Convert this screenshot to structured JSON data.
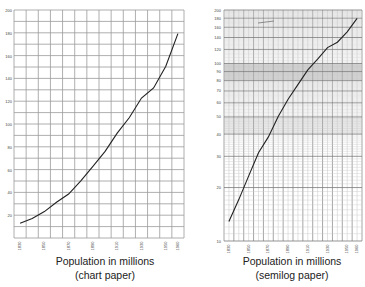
{
  "chart_data": [
    {
      "type": "line",
      "title": "Population in millions",
      "subtitle": "(chart paper)",
      "xlabel": "",
      "ylabel": "",
      "x_tick_labels": [
        "1830",
        "1850",
        "1870",
        "1890",
        "1910",
        "1930",
        "1950",
        "1960"
      ],
      "y_tick_labels": [
        "20",
        "40",
        "60",
        "80",
        "100",
        "120",
        "140",
        "160",
        "180",
        "200"
      ],
      "ylim": [
        0,
        200
      ],
      "xlim": [
        1825,
        1965
      ],
      "grid": true,
      "y_scale": "linear",
      "x": [
        1830,
        1840,
        1850,
        1860,
        1870,
        1880,
        1890,
        1900,
        1910,
        1920,
        1930,
        1940,
        1950,
        1960
      ],
      "series": [
        {
          "name": "Population",
          "values": [
            12.9,
            17.1,
            23.2,
            31.4,
            38.6,
            50.2,
            62.9,
            76.0,
            92.0,
            105.7,
            122.8,
            131.7,
            150.7,
            179.3
          ]
        }
      ]
    },
    {
      "type": "line",
      "title": "Population in millions",
      "subtitle": "(semilog paper)",
      "xlabel": "",
      "ylabel": "",
      "x_tick_labels": [
        "1830",
        "1850",
        "1870",
        "1890",
        "1910",
        "1930",
        "1950",
        "1960"
      ],
      "y_tick_labels": [
        "10",
        "20",
        "30",
        "40",
        "50",
        "60",
        "70",
        "80",
        "90",
        "100",
        "120",
        "140",
        "160",
        "180",
        "200"
      ],
      "ylim": [
        10,
        200
      ],
      "xlim": [
        1825,
        1965
      ],
      "grid": true,
      "y_scale": "log",
      "x": [
        1830,
        1840,
        1850,
        1860,
        1870,
        1880,
        1890,
        1900,
        1910,
        1920,
        1930,
        1940,
        1950,
        1960
      ],
      "series": [
        {
          "name": "Population",
          "values": [
            12.9,
            17.1,
            23.2,
            31.4,
            38.6,
            50.2,
            62.9,
            76.0,
            92.0,
            105.7,
            122.8,
            131.7,
            150.7,
            179.3
          ]
        }
      ]
    }
  ],
  "captions": {
    "left_title": "Population in millions",
    "left_sub": "(chart paper)",
    "right_title": "Population in millions",
    "right_sub": "(semilog paper)"
  }
}
